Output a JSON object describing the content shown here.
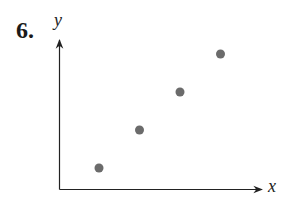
{
  "problem_number": "6.",
  "chart_data": {
    "type": "scatter",
    "title": "",
    "xlabel": "x",
    "ylabel": "y",
    "grid": false,
    "ticks": false,
    "points": [
      {
        "x": 1,
        "y": 1
      },
      {
        "x": 2,
        "y": 2
      },
      {
        "x": 3,
        "y": 3
      },
      {
        "x": 4,
        "y": 4
      }
    ],
    "point_color": "#6b6b6b",
    "axis_color": "#222222"
  }
}
